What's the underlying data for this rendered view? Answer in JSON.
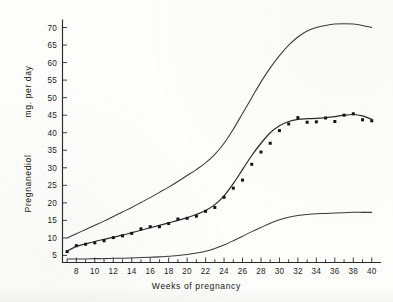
{
  "chart_data": {
    "type": "line",
    "title": "",
    "xlabel": "Weeks of pregnancy",
    "ylabel": "Pregnanediol",
    "ylabel_units": "mg. per day",
    "xlim": [
      6.5,
      41
    ],
    "ylim": [
      3,
      72
    ],
    "grid": false,
    "legend": "none",
    "x_ticks_major": [
      8,
      10,
      12,
      14,
      16,
      18,
      20,
      22,
      24,
      26,
      28,
      30,
      32,
      34,
      36,
      38,
      40
    ],
    "x_tick_labels": [
      "8",
      "10",
      "12",
      "14",
      "16",
      "18",
      "20",
      "22",
      "24",
      "26",
      "28",
      "30",
      "32",
      "34",
      "36",
      "38",
      "40"
    ],
    "x_minor_tick_interval": 1,
    "y_ticks": [
      5,
      10,
      15,
      20,
      25,
      30,
      35,
      40,
      45,
      50,
      55,
      60,
      65,
      70
    ],
    "y_tick_labels": [
      "5",
      "10",
      "15",
      "20",
      "25",
      "30",
      "35",
      "40",
      "45",
      "50",
      "55",
      "60",
      "65",
      "70"
    ],
    "series": [
      {
        "name": "upper-limit-curve",
        "style": "line",
        "x": [
          7,
          8,
          9,
          10,
          11,
          12,
          13,
          14,
          15,
          16,
          17,
          18,
          19,
          20,
          21,
          22,
          23,
          24,
          25,
          26,
          27,
          28,
          29,
          30,
          31,
          32,
          33,
          34,
          35,
          36,
          37,
          38,
          39,
          40
        ],
        "values": [
          10.0,
          11.2,
          12.4,
          13.6,
          14.8,
          16.1,
          17.4,
          18.7,
          20.1,
          21.5,
          23.0,
          24.5,
          26.1,
          27.8,
          29.5,
          31.4,
          33.8,
          37.0,
          41.0,
          45.5,
          50.0,
          54.5,
          58.5,
          62.0,
          65.0,
          67.3,
          69.0,
          70.0,
          70.6,
          71.0,
          71.1,
          71.0,
          70.6,
          70.0
        ]
      },
      {
        "name": "mean-curve",
        "style": "line",
        "x": [
          7,
          8,
          9,
          10,
          11,
          12,
          13,
          14,
          15,
          16,
          17,
          18,
          19,
          20,
          21,
          22,
          23,
          24,
          25,
          26,
          27,
          28,
          29,
          30,
          31,
          32,
          33,
          34,
          35,
          36,
          37,
          38,
          39,
          40
        ],
        "values": [
          6.2,
          7.6,
          8.3,
          9.0,
          9.6,
          10.2,
          10.8,
          11.5,
          12.2,
          12.9,
          13.6,
          14.3,
          15.0,
          15.8,
          16.7,
          17.8,
          19.5,
          22.0,
          25.5,
          29.5,
          33.5,
          37.0,
          40.0,
          42.0,
          43.2,
          43.8,
          44.0,
          44.1,
          44.3,
          44.6,
          45.0,
          45.2,
          44.8,
          43.8
        ]
      },
      {
        "name": "lower-limit-curve",
        "style": "line",
        "x": [
          7,
          8,
          9,
          10,
          11,
          12,
          13,
          14,
          15,
          16,
          17,
          18,
          19,
          20,
          21,
          22,
          23,
          24,
          25,
          26,
          27,
          28,
          29,
          30,
          31,
          32,
          33,
          34,
          35,
          36,
          37,
          38,
          39,
          40
        ],
        "values": [
          4.0,
          4.0,
          4.0,
          4.1,
          4.1,
          4.2,
          4.2,
          4.3,
          4.4,
          4.5,
          4.6,
          4.8,
          5.0,
          5.3,
          5.7,
          6.2,
          7.0,
          8.0,
          9.2,
          10.5,
          11.8,
          13.0,
          14.2,
          15.2,
          15.9,
          16.4,
          16.7,
          16.9,
          17.0,
          17.1,
          17.2,
          17.3,
          17.3,
          17.3
        ]
      },
      {
        "name": "observed-points",
        "style": "scatter",
        "x": [
          7,
          8,
          9,
          10,
          11,
          12,
          13,
          14,
          15,
          16,
          17,
          18,
          19,
          20,
          21,
          22,
          23,
          24,
          25,
          26,
          27,
          28,
          29,
          30,
          31,
          32,
          33,
          34,
          35,
          36,
          37,
          38,
          39,
          40
        ],
        "values": [
          6.1,
          7.8,
          8.2,
          8.6,
          9.2,
          10.1,
          10.6,
          11.3,
          12.6,
          13.2,
          13.2,
          14.1,
          15.4,
          15.6,
          16.2,
          17.6,
          18.7,
          21.6,
          24.2,
          26.5,
          31.0,
          34.5,
          37.0,
          40.6,
          42.5,
          44.3,
          43.0,
          43.1,
          44.2,
          43.2,
          45.0,
          45.4,
          43.7,
          43.4
        ]
      }
    ]
  },
  "axes": {
    "x_caption": "Weeks of pregnancy",
    "y_caption_primary": "Pregnanediol",
    "y_caption_secondary": "mg. per day"
  },
  "colors": {
    "ink": "#2a2a2a",
    "paper": "#fdfdfc",
    "dot": "#141414"
  }
}
